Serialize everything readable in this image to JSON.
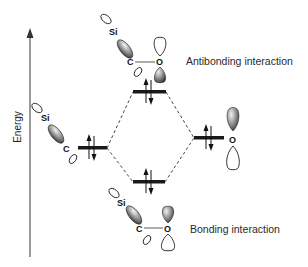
{
  "axis": {
    "label": "Energy",
    "color": "#555555"
  },
  "levels": {
    "left_fragment": {
      "name": "Si-C orbital",
      "electrons": 2
    },
    "right_fragment": {
      "name": "O p-orbital",
      "electrons": 2
    },
    "antibonding": {
      "electrons": 2
    },
    "bonding": {
      "electrons": 2
    }
  },
  "labels": {
    "antibonding": "Antibonding interaction",
    "bonding": "Bonding interaction"
  },
  "atoms": {
    "si": "Si",
    "c": "C",
    "o": "O"
  },
  "colors": {
    "level_bar": "#1a1a1a",
    "dashed_line": "#333333",
    "shaded_lobe_dark": "#3a3a3a",
    "shaded_lobe_light": "#e8e8e8",
    "open_lobe_stroke": "#222222"
  }
}
